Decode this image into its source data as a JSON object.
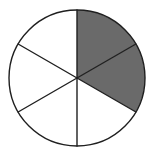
{
  "figure": {
    "name": "fraction-pie-diagram",
    "background_color": "#ffffff"
  },
  "chart_data": {
    "type": "pie",
    "title": "",
    "subtitle": "",
    "xlabel": "",
    "ylabel": "",
    "grid": false,
    "legend": false,
    "legend_position": "none",
    "total_slices": 6,
    "shaded_slices": 2,
    "unshaded_slices": 4,
    "fraction_shaded": "2/6",
    "fraction_shaded_simplified": "1/3",
    "percent_shaded": 33.3,
    "slice_angle_degrees": 60,
    "categories": [
      "slice-1",
      "slice-2",
      "slice-3",
      "slice-4",
      "slice-5",
      "slice-6"
    ],
    "values": [
      60,
      60,
      60,
      60,
      60,
      60
    ],
    "series": [
      {
        "name": "sectors",
        "values": [
          60,
          60,
          60,
          60,
          60,
          60
        ]
      }
    ],
    "slices": [
      {
        "id": "slice-1",
        "start_angle": 90,
        "end_angle": 30,
        "sweep_degrees": 60,
        "shaded": true,
        "fill": "#6a6a6a"
      },
      {
        "id": "slice-2",
        "start_angle": 30,
        "end_angle": -30,
        "sweep_degrees": 60,
        "shaded": true,
        "fill": "#6a6a6a"
      },
      {
        "id": "slice-3",
        "start_angle": -30,
        "end_angle": -90,
        "sweep_degrees": 60,
        "shaded": false,
        "fill": "#ffffff"
      },
      {
        "id": "slice-4",
        "start_angle": -90,
        "end_angle": -150,
        "sweep_degrees": 60,
        "shaded": false,
        "fill": "#ffffff"
      },
      {
        "id": "slice-5",
        "start_angle": -150,
        "end_angle": 150,
        "sweep_degrees": 60,
        "shaded": false,
        "fill": "#ffffff"
      },
      {
        "id": "slice-6",
        "start_angle": 150,
        "end_angle": 90,
        "sweep_degrees": 60,
        "shaded": false,
        "fill": "#ffffff"
      }
    ],
    "geometry": {
      "center_x": 77,
      "center_y": 78,
      "radius": 68
    },
    "colors": {
      "shaded_fill": "#6a6a6a",
      "unshaded_fill": "#ffffff",
      "outline": "#1f1f1f",
      "divider": "#1f1f1f"
    },
    "stroke_width": 1.4,
    "annotations": []
  }
}
